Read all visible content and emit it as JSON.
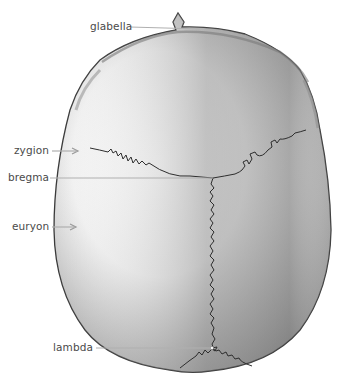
{
  "diagram": {
    "colors": {
      "background": "#ffffff",
      "label_text": "#4a4a4a",
      "leader_line": "#b0b0b0",
      "bone_light": "#f4f4f4",
      "bone_shadow": "#9a9a9a",
      "outline": "#3a3a3a",
      "suture": "#2e2e2e"
    },
    "labels": [
      {
        "id": "glabella",
        "text": "glabella",
        "x": 90,
        "y": 22
      },
      {
        "id": "zygion",
        "text": "zygion",
        "x": 14,
        "y": 146
      },
      {
        "id": "bregma",
        "text": "bregma",
        "x": 8,
        "y": 173
      },
      {
        "id": "euryon",
        "text": "euryon",
        "x": 12,
        "y": 222
      },
      {
        "id": "lambda",
        "text": "lambda",
        "x": 53,
        "y": 343
      }
    ]
  }
}
